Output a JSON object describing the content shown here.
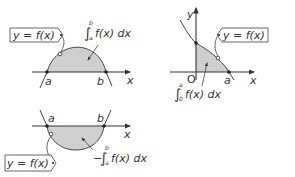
{
  "panels": [
    {
      "id": "positive-area",
      "curve_label": "y = f(x)",
      "area_label": {
        "prefix": "",
        "integral": "∫",
        "lower": "a",
        "upper": "b",
        "integrand": "f(x) dx"
      },
      "x_axis_label": "x",
      "points": [
        "a",
        "b"
      ]
    },
    {
      "id": "negative-area",
      "curve_label": "y = f(x)",
      "area_label": {
        "prefix": "−",
        "integral": "∫",
        "lower": "a",
        "upper": "b",
        "integrand": "f(x) dx"
      },
      "x_axis_label": "x",
      "points": [
        "a",
        "b"
      ]
    },
    {
      "id": "origin-area",
      "curve_label": "y = f(x)",
      "area_label": {
        "prefix": "",
        "integral": "∫",
        "lower": "0",
        "upper": "a",
        "integrand": "f(x) dx"
      },
      "x_axis_label": "x",
      "y_axis_label": "y",
      "origin_label": "O",
      "points": [
        "a"
      ]
    }
  ],
  "colors": {
    "shade": "#cfcfcf",
    "line": "#333333"
  }
}
